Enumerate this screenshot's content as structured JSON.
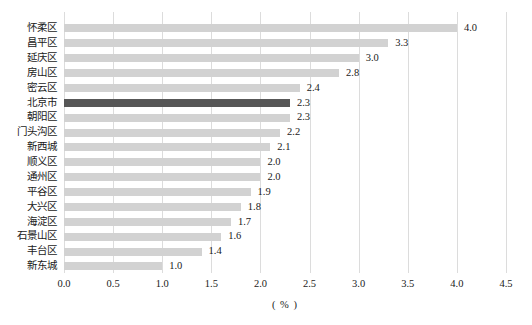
{
  "colors": {
    "background": "#ffffff",
    "bar_default": "#d2d2d2",
    "bar_highlight": "#575757",
    "gridline": "#dcdcdc",
    "text": "#1a1a1a"
  },
  "chart_data": {
    "type": "bar",
    "orientation": "horizontal",
    "title": "",
    "xlabel": "( % )",
    "ylabel": "",
    "xlim": [
      0,
      4.5
    ],
    "grid": "vertical",
    "legend": "none",
    "categories": [
      "怀柔区",
      "昌平区",
      "延庆区",
      "房山区",
      "密云区",
      "北京市",
      "朝阳区",
      "门头沟区",
      "新西城",
      "顺义区",
      "通州区",
      "平谷区",
      "大兴区",
      "海淀区",
      "石景山区",
      "丰台区",
      "新东城"
    ],
    "values": [
      4.0,
      3.3,
      3.0,
      2.8,
      2.4,
      2.3,
      2.3,
      2.2,
      2.1,
      2.0,
      2.0,
      1.9,
      1.8,
      1.7,
      1.6,
      1.4,
      1.0
    ],
    "value_labels": [
      "4.0",
      "3.3",
      "3.0",
      "2.8",
      "2.4",
      "2.3",
      "2.3",
      "2.2",
      "2.1",
      "2.0",
      "2.0",
      "1.9",
      "1.8",
      "1.7",
      "1.6",
      "1.4",
      "1.0"
    ],
    "highlight_index": 5,
    "highlight_category": "北京市",
    "x_tick_labels": [
      "0.0",
      "0.5",
      "1.0",
      "1.5",
      "2.0",
      "2.5",
      "3.0",
      "3.5",
      "4.0",
      "4.5"
    ]
  }
}
